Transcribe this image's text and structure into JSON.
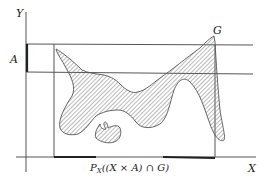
{
  "figure": {
    "axes": {
      "x_label": "X",
      "y_label": "Y"
    },
    "set_label": "A",
    "graph_label": "ɢ",
    "graph_label_display": "G",
    "projection_label": {
      "prefix": "P",
      "subscript": "X",
      "body": "((X × A) ∩ ",
      "graph": "G",
      "suffix": ")"
    },
    "colors": {
      "line": "#555555",
      "thick_line": "#222222",
      "fill_hatch": "#777777",
      "background": "#ffffff"
    }
  }
}
